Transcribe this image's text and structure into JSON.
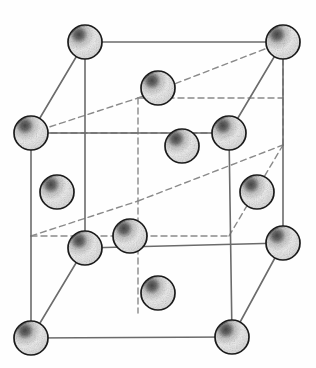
{
  "figure": {
    "name": "fcc-unit-cell",
    "background_color": "#fefefe",
    "line_color": "#6b6b6b",
    "hidden_line_color": "#8a8a8a",
    "sphere_outline_color": "#1a1a1a",
    "sphere_fill_color": "#f2f2f2",
    "sphere_shade_color": "#2b2b2b",
    "sphere_radius": 17,
    "solid_stroke_width": 1.6,
    "dashed_stroke_width": 1.4,
    "dash_pattern": "6 4"
  },
  "cube": {
    "vertices": [
      {
        "id": "back-top-left",
        "label": "Back top left",
        "x": 85,
        "y": 42
      },
      {
        "id": "back-top-right",
        "label": "Back top right",
        "x": 283,
        "y": 42
      },
      {
        "id": "front-top-left",
        "label": "Front top left",
        "x": 31,
        "y": 133
      },
      {
        "id": "front-top-right",
        "label": "Front top right",
        "x": 229,
        "y": 133
      },
      {
        "id": "back-bottom-left",
        "label": "Back bottom left",
        "x": 85,
        "y": 248
      },
      {
        "id": "back-bottom-right",
        "label": "Back bottom right",
        "x": 283,
        "y": 243
      },
      {
        "id": "front-bottom-left",
        "label": "Front bottom left",
        "x": 31,
        "y": 338
      },
      {
        "id": "front-bottom-right",
        "label": "Front bottom right",
        "x": 232,
        "y": 337
      }
    ],
    "edges_solid": [
      {
        "id": "edge-back-top",
        "from": "back-top-left",
        "to": "back-top-right"
      },
      {
        "id": "edge-front-top",
        "from": "front-top-left",
        "to": "front-top-right"
      },
      {
        "id": "edge-front-bottom",
        "from": "front-bottom-left",
        "to": "front-bottom-right"
      },
      {
        "id": "edge-back-bottom",
        "from": "back-bottom-left",
        "to": "back-bottom-right"
      },
      {
        "id": "edge-left-back-vertical",
        "from": "back-top-left",
        "to": "back-bottom-left"
      },
      {
        "id": "edge-right-back-vertical",
        "from": "back-top-right",
        "to": "back-bottom-right"
      },
      {
        "id": "edge-left-front-vertical",
        "from": "front-top-left",
        "to": "front-bottom-left"
      },
      {
        "id": "edge-right-front-vertical",
        "from": "front-top-right",
        "to": "front-bottom-right"
      },
      {
        "id": "edge-top-left-diagonal",
        "from": "back-top-left",
        "to": "front-top-left"
      },
      {
        "id": "edge-top-right-diagonal",
        "from": "back-top-right",
        "to": "front-top-right"
      },
      {
        "id": "edge-bottom-left-diagonal",
        "from": "back-bottom-left",
        "to": "front-bottom-left"
      },
      {
        "id": "edge-bottom-right-diagonal",
        "from": "back-bottom-right",
        "to": "front-bottom-right"
      }
    ],
    "hidden_vertex": {
      "id": "hidden-back-inner",
      "label": "Hidden inner vertex",
      "x": 138,
      "y": 98
    },
    "edges_dashed": [
      {
        "id": "hidden-edge-up-left",
        "x1": 31,
        "y1": 133,
        "x2": 138,
        "y2": 98
      },
      {
        "id": "hidden-edge-up-right",
        "x1": 138,
        "y1": 98,
        "x2": 283,
        "y2": 42
      },
      {
        "id": "hidden-edge-horiz-top",
        "x1": 138,
        "y1": 98,
        "x2": 283,
        "y2": 98
      },
      {
        "id": "hidden-edge-vert",
        "x1": 138,
        "y1": 98,
        "x2": 138,
        "y2": 313
      },
      {
        "id": "hidden-edge-left-mid",
        "x1": 31,
        "y1": 133,
        "x2": 229,
        "y2": 133
      },
      {
        "id": "hidden-edge-low-left",
        "x1": 31,
        "y1": 236,
        "x2": 138,
        "y2": 201
      },
      {
        "id": "hidden-edge-low-horiz",
        "x1": 31,
        "y1": 236,
        "x2": 229,
        "y2": 236
      },
      {
        "id": "hidden-edge-low-right",
        "x1": 138,
        "y1": 201,
        "x2": 283,
        "y2": 145
      },
      {
        "id": "hidden-edge-low-up",
        "x1": 229,
        "y1": 236,
        "x2": 283,
        "y2": 145
      },
      {
        "id": "hidden-edge-mid-right",
        "x1": 283,
        "y1": 145,
        "x2": 283,
        "y2": 42
      }
    ]
  },
  "atoms": [
    {
      "id": "atom-corner-back-top-left",
      "role": "corner",
      "label": "Corner atom (back top left)",
      "x": 85,
      "y": 42
    },
    {
      "id": "atom-corner-back-top-right",
      "role": "corner",
      "label": "Corner atom (back top right)",
      "x": 283,
      "y": 42
    },
    {
      "id": "atom-face-top",
      "role": "face",
      "label": "Face-center atom (top face)",
      "x": 158,
      "y": 88
    },
    {
      "id": "atom-corner-front-top-left",
      "role": "corner",
      "label": "Corner atom (front top left)",
      "x": 31,
      "y": 133
    },
    {
      "id": "atom-face-back",
      "role": "face",
      "label": "Face-center atom (back face)",
      "x": 229,
      "y": 133
    },
    {
      "id": "atom-face-right-upper",
      "role": "face",
      "label": "Face-center atom (right face)",
      "x": 182,
      "y": 146
    },
    {
      "id": "atom-face-left",
      "role": "face",
      "label": "Face-center atom (left face)",
      "x": 57,
      "y": 192
    },
    {
      "id": "atom-face-right",
      "role": "face",
      "label": "Face-center atom (right face)",
      "x": 257,
      "y": 192
    },
    {
      "id": "atom-face-front",
      "role": "face",
      "label": "Face-center atom (front face)",
      "x": 130,
      "y": 236
    },
    {
      "id": "atom-corner-back-bottom-left",
      "role": "corner",
      "label": "Corner atom (back bottom left)",
      "x": 85,
      "y": 248
    },
    {
      "id": "atom-corner-back-bottom-right",
      "role": "corner",
      "label": "Corner atom (back bottom right)",
      "x": 283,
      "y": 243
    },
    {
      "id": "atom-face-bottom",
      "role": "face",
      "label": "Face-center atom (bottom face)",
      "x": 158,
      "y": 293
    },
    {
      "id": "atom-corner-front-bottom-left",
      "role": "corner",
      "label": "Corner atom (front bottom left)",
      "x": 31,
      "y": 338
    },
    {
      "id": "atom-corner-front-bottom-right",
      "role": "corner",
      "label": "Corner atom (front bottom right)",
      "x": 232,
      "y": 337
    }
  ]
}
